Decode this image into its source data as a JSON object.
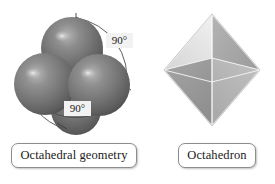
{
  "figure": {
    "background_color": "#ffffff",
    "panels": [
      {
        "id": "octahedral-geometry",
        "caption": "Octahedral geometry",
        "art": "space-filling-sphere-cluster",
        "annotations": [
          {
            "id": "angle-top",
            "value": "90",
            "unit": "°"
          },
          {
            "id": "angle-bottom",
            "value": "90",
            "unit": "°"
          }
        ],
        "sphere_color": "#6f6f6f",
        "sphere_highlight_color": "#d8d8d8",
        "arc_color": "#555555"
      },
      {
        "id": "octahedron",
        "caption": "Octahedron",
        "art": "octahedron-solid",
        "face_light_color": "#e2e2e2",
        "face_mid_color": "#c9c9c9",
        "face_dark_color": "#9a9a9a",
        "edge_color": "#ffffff"
      }
    ]
  },
  "labels": {
    "angle_top": "90°",
    "angle_bottom": "90°",
    "caption_left": "Octahedral geometry",
    "caption_right": "Octahedron"
  }
}
